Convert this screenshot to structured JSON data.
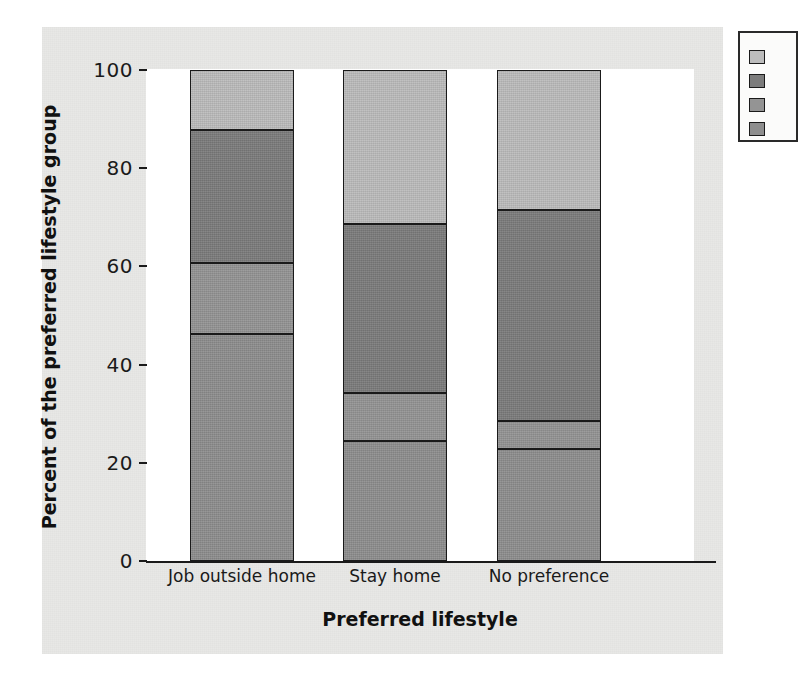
{
  "chart_data": {
    "type": "bar",
    "subtype": "stacked-percent",
    "title": "",
    "xlabel": "Preferred lifestyle",
    "ylabel": "Percent of the preferred lifestyle group",
    "categories": [
      "Job outside home",
      "Stay home",
      "No preference"
    ],
    "ylim": [
      0,
      100
    ],
    "yticks": [
      0,
      20,
      40,
      60,
      80,
      100
    ],
    "ytick_labels": [
      "0",
      "20",
      "40",
      "60",
      "80",
      "100"
    ],
    "grid": false,
    "legend_position": "right-outside",
    "legend_clipped": true,
    "series": [
      {
        "name": "segment-1",
        "swatch": "#8e8e8e",
        "legend_label": "",
        "values": [
          46.2,
          24.4,
          22.8
        ]
      },
      {
        "name": "segment-2",
        "swatch": "#949494",
        "legend_label": "",
        "values": [
          14.5,
          9.8,
          5.7
        ]
      },
      {
        "name": "segment-3",
        "swatch": "#7c7c7c",
        "legend_label": "",
        "values": [
          27.1,
          34.4,
          43.0
        ]
      },
      {
        "name": "segment-4",
        "swatch": "#bcbcbc",
        "legend_label": "",
        "values": [
          12.2,
          31.4,
          28.5
        ]
      }
    ],
    "cumulative_boundaries": [
      [
        46.2,
        60.7,
        87.8,
        100.0
      ],
      [
        24.4,
        34.2,
        68.6,
        100.0
      ],
      [
        22.8,
        28.5,
        71.5,
        100.0
      ]
    ]
  },
  "legend": {
    "items": [
      {
        "label": "",
        "color": "#bcbcbc"
      },
      {
        "label": "",
        "color": "#7c7c7c"
      },
      {
        "label": "",
        "color": "#949494"
      },
      {
        "label": "",
        "color": "#8e8e8e"
      }
    ]
  },
  "colors": {
    "page_background": "#e8e8e6",
    "plot_background": "#ffffff",
    "axis": "#1a1a1a",
    "text": "#1a1a1a"
  }
}
